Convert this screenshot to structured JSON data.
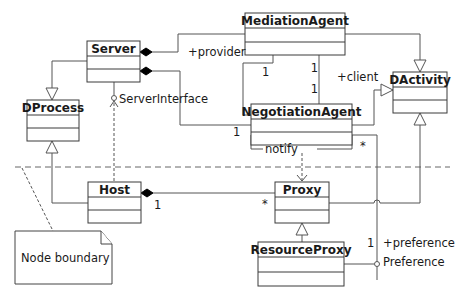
{
  "diagram": {
    "type": "uml-class-diagram",
    "classes": [
      {
        "id": "server",
        "name": "Server"
      },
      {
        "id": "mediation",
        "name": "MediationAgent"
      },
      {
        "id": "dactivity",
        "name": "DActivity"
      },
      {
        "id": "dprocess",
        "name": "DProcess"
      },
      {
        "id": "negotiation",
        "name": "NegotiationAgent"
      },
      {
        "id": "host",
        "name": "Host"
      },
      {
        "id": "proxy",
        "name": "Proxy"
      },
      {
        "id": "resourceproxy",
        "name": "ResourceProxy"
      }
    ],
    "labels": {
      "provider": "+provider",
      "client": "+client",
      "server_interface": "ServerInterface",
      "notify": "notify",
      "preference_role": "+preference",
      "preference_iface": "Preference"
    },
    "multiplicities": {
      "mediation_negotiation_provider_top": "1",
      "mediation_negotiation_client_top": "1",
      "mediation_negotiation_client_bottom": "1",
      "server_negotiation": "1",
      "negotiation_star": "*",
      "host_proxy_one": "1",
      "host_proxy_star": "*",
      "preference_one": "1"
    },
    "note": {
      "text": "Node boundary"
    }
  }
}
